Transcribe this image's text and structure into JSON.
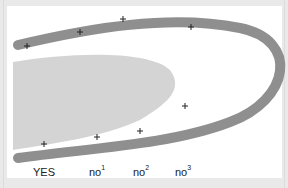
{
  "diagram": {
    "colors": {
      "background": "#ffffff",
      "frame": "#e9e9e9",
      "band": "#8f8f8f",
      "blob": "#d4d4d4",
      "marker": "#222222",
      "label_text": "#222222"
    },
    "band": {
      "description": "thick gray U-shaped curve opening to the left",
      "path": "M 18 45 C 90 28, 170 14, 240 28 C 300 40, 290 100, 230 122 C 170 145, 90 148, 18 158",
      "stroke_width": 10
    },
    "blob": {
      "description": "light gray filled region inside the curve",
      "path": "M 13 62 C 70 52, 150 50, 170 70 C 185 90, 165 105, 140 120 C 100 138, 50 144, 13 150 Z"
    },
    "markers": {
      "top": [
        {
          "x": 27,
          "y": 46
        },
        {
          "x": 80,
          "y": 32
        },
        {
          "x": 123,
          "y": 19
        },
        {
          "x": 191,
          "y": 27
        }
      ],
      "bottom": [
        {
          "x": 44,
          "y": 144
        },
        {
          "x": 97,
          "y": 137
        },
        {
          "x": 140,
          "y": 131
        },
        {
          "x": 185,
          "y": 106
        }
      ]
    },
    "labels": [
      {
        "text": "YES",
        "sup": "",
        "x": 33
      },
      {
        "text": "no",
        "sup": "1",
        "x": 89
      },
      {
        "text": "no",
        "sup": "2",
        "x": 133
      },
      {
        "text": "no",
        "sup": "3",
        "x": 175
      }
    ]
  }
}
